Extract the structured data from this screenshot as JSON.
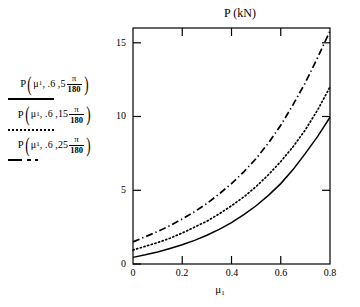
{
  "chart": {
    "title": "P (kN)",
    "xlabel": "μ",
    "xlabel_sub": "1",
    "yticks": [
      "0",
      "5",
      "10",
      "15"
    ],
    "xticks": [
      "0",
      "0.2",
      "0.4",
      "0.6",
      "0.8"
    ]
  },
  "legend": {
    "entries": [
      {
        "fn": "P",
        "arg1": "μ",
        "arg1_sub": "1",
        "arg2": ", .6 ,",
        "coef": "5",
        "num": "π",
        "den": "180",
        "style": "solid",
        "style_label": "solid-line-sample"
      },
      {
        "fn": "P",
        "arg1": "μ",
        "arg1_sub": "1",
        "arg2": ", .6 ,",
        "coef": "15",
        "num": "π",
        "den": "180",
        "style": "dotted",
        "style_label": "dotted-line-sample"
      },
      {
        "fn": "P",
        "arg1": "μ",
        "arg1_sub": "1",
        "arg2": ", .6 ,",
        "coef": "25",
        "num": "π",
        "den": "180",
        "style": "dashdot",
        "style_label": "dashdot-line-sample"
      }
    ]
  },
  "chart_data": {
    "type": "line",
    "title": "P (kN)",
    "xlabel": "μ1",
    "ylabel": "P (kN)",
    "xlim": [
      0,
      0.8
    ],
    "ylim": [
      0,
      16
    ],
    "grid": false,
    "legend_position": "left-outside",
    "x": [
      0,
      0.05,
      0.1,
      0.15,
      0.2,
      0.25,
      0.3,
      0.35,
      0.4,
      0.45,
      0.5,
      0.55,
      0.6,
      0.65,
      0.7,
      0.75,
      0.8
    ],
    "series": [
      {
        "name": "P(μ1, .6, 5π/180)",
        "style": "solid",
        "values": [
          0.45,
          0.62,
          0.82,
          1.05,
          1.3,
          1.6,
          1.95,
          2.35,
          2.8,
          3.35,
          3.95,
          4.65,
          5.45,
          6.4,
          7.5,
          8.65,
          9.95
        ]
      },
      {
        "name": "P(μ1, .6, 15π/180)",
        "style": "dotted",
        "values": [
          0.95,
          1.2,
          1.45,
          1.75,
          2.1,
          2.5,
          2.9,
          3.4,
          3.95,
          4.55,
          5.25,
          6.05,
          6.95,
          7.95,
          9.1,
          10.45,
          12.0
        ]
      },
      {
        "name": "P(μ1, .6, 25π/180)",
        "style": "dashdot",
        "values": [
          1.5,
          1.85,
          2.2,
          2.6,
          3.05,
          3.55,
          4.1,
          4.75,
          5.45,
          6.25,
          7.15,
          8.2,
          9.4,
          10.8,
          12.3,
          14.0,
          15.8
        ]
      }
    ]
  },
  "colors": {
    "line": "#000000",
    "axis": "#000000",
    "background": "#ffffff"
  }
}
